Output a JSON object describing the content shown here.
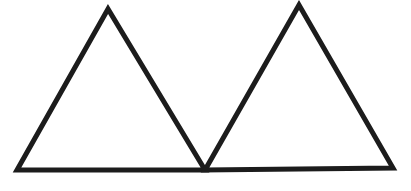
{
  "diagram": {
    "background": "#ffffff",
    "stroke_color": "#1c1c1c",
    "stroke_width": 5,
    "shapes": [
      {
        "id": "left-triangle",
        "type": "triangle",
        "points": [
          [
            108,
            9
          ],
          [
            17,
            170
          ],
          [
            205,
            170
          ]
        ]
      },
      {
        "id": "right-triangle",
        "type": "triangle",
        "points": [
          [
            299,
            5
          ],
          [
            205,
            170
          ],
          [
            393,
            168
          ]
        ]
      }
    ]
  }
}
